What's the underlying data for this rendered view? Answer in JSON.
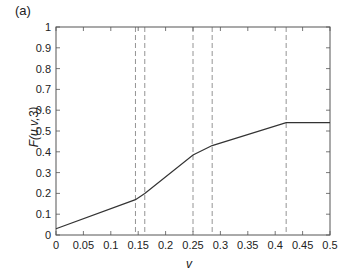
{
  "panel_label": "(a)",
  "chart_data": {
    "type": "line",
    "title": "",
    "xlabel": "v",
    "ylabel": "F(u,v,3)",
    "xlim": [
      0,
      0.5
    ],
    "ylim": [
      0,
      1
    ],
    "xticks": [
      "0",
      "0.05",
      "0.1",
      "0.15",
      "0.2",
      "0.25",
      "0.3",
      "0.35",
      "0.4",
      "0.45",
      "0.5"
    ],
    "yticks": [
      "0",
      "0.1",
      "0.2",
      "0.3",
      "0.4",
      "0.5",
      "0.6",
      "0.7",
      "0.8",
      "0.9",
      "1"
    ],
    "grid": false,
    "legend": null,
    "series": [
      {
        "name": "F(u,v,3)",
        "style": "solid",
        "x": [
          0,
          0.145,
          0.162,
          0.25,
          0.285,
          0.42,
          0.5
        ],
        "y": [
          0.03,
          0.17,
          0.2,
          0.385,
          0.43,
          0.54,
          0.54
        ]
      }
    ],
    "vertical_dashed_lines": [
      0.145,
      0.162,
      0.25,
      0.285,
      0.42
    ]
  },
  "colors": {
    "line": "#333333",
    "dashed": "#888888",
    "axis": "#555555"
  }
}
